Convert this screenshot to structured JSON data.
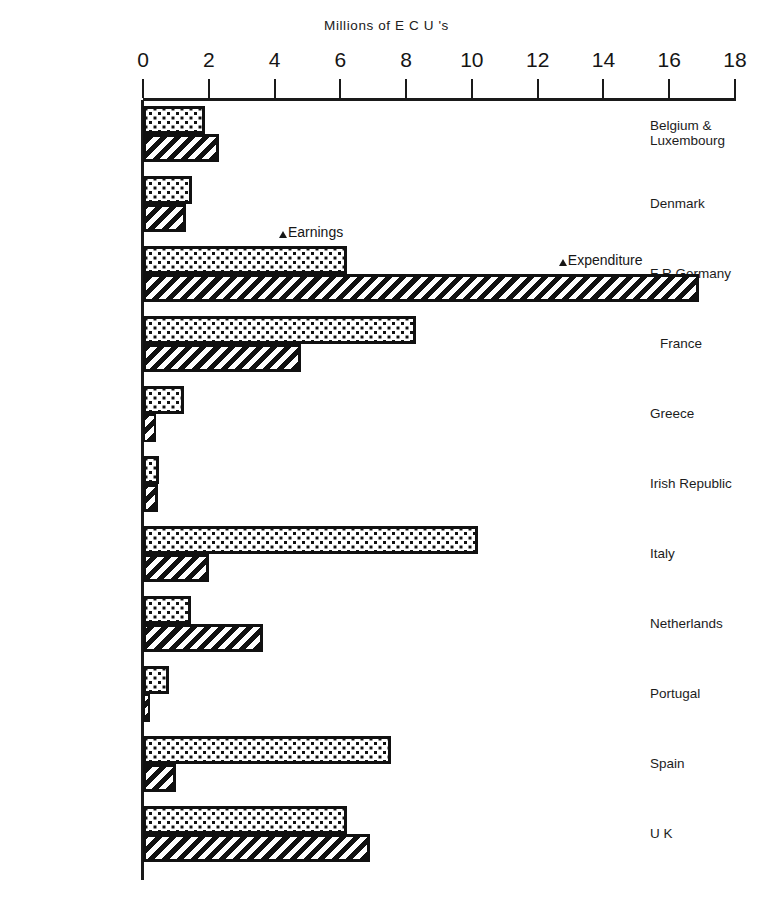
{
  "chart_data": {
    "type": "bar",
    "orientation": "horizontal",
    "title": "Millions of E C U 's",
    "xlabel": "",
    "ylabel": "",
    "xlim": [
      0,
      18
    ],
    "xticks": [
      0,
      2,
      4,
      6,
      8,
      10,
      12,
      14,
      16,
      18
    ],
    "xtick_labels": [
      "0",
      "2",
      "4",
      "6",
      "8",
      "10",
      "12",
      "14",
      "16",
      "18"
    ],
    "grid": false,
    "legend_position": "inline-annotation",
    "categories": [
      "Belgium &\nLuxembourg",
      "Denmark",
      "F R  Germany",
      "France",
      "Greece",
      "Irish Republic",
      "Italy",
      "Netherlands",
      "Portugal",
      "Spain",
      "U K"
    ],
    "series": [
      {
        "name": "Earnings",
        "pattern": "dotted",
        "values": [
          1.9,
          1.5,
          6.2,
          8.3,
          1.25,
          0.5,
          10.2,
          1.45,
          0.8,
          7.55,
          6.2
        ]
      },
      {
        "name": "Expenditure",
        "pattern": "hatched",
        "values": [
          2.3,
          1.3,
          16.9,
          4.8,
          0.4,
          0.45,
          2.0,
          3.65,
          0.15,
          1.0,
          6.9
        ]
      }
    ],
    "annotations": [
      {
        "text": "Earnings",
        "marker": "triangle-up"
      },
      {
        "text": "Expenditure",
        "marker": "triangle-up"
      }
    ],
    "colors": {
      "ink": "#111111",
      "background": "#ffffff"
    }
  }
}
